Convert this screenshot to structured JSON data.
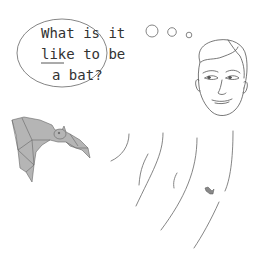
{
  "speech_bubble": {
    "lines": [
      "What is it",
      "like to be",
      "a bat?"
    ],
    "underlined_word": "like",
    "line2_rest": " to be"
  },
  "figures": {
    "person": "human-face",
    "animal": "bat",
    "insect": "moth"
  },
  "colors": {
    "line": "#555555",
    "bat_fill": "#b5b5b5",
    "background": "#ffffff"
  }
}
